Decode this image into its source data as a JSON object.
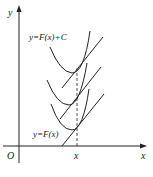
{
  "diagram": {
    "y_axis_label": "y",
    "x_axis_label": "x",
    "origin_label": "O",
    "x_tick_label": "x",
    "top_curve_label": "y=F(x)+C",
    "bottom_curve_label": "y=F(x)",
    "colors": {
      "stroke": "#222222",
      "background": "#ffffff"
    }
  }
}
